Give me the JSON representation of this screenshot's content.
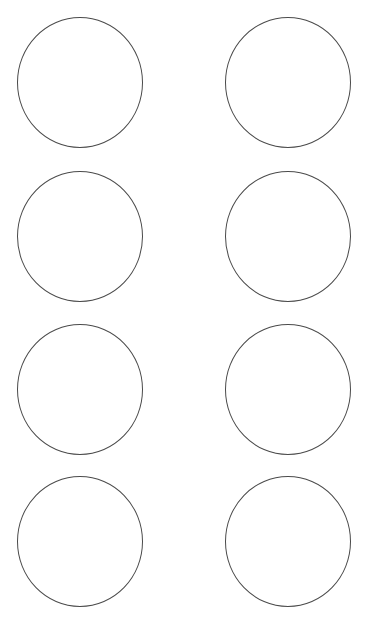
{
  "sheet": {
    "background": "#ffffff",
    "stroke_color": "#4a4a4a",
    "layout": {
      "columns": 2,
      "rows": 4
    },
    "circles": [
      {
        "row": 1,
        "col": 1,
        "cx": 80,
        "cy": 83,
        "r": 64
      },
      {
        "row": 1,
        "col": 2,
        "cx": 288,
        "cy": 83,
        "r": 64
      },
      {
        "row": 2,
        "col": 1,
        "cx": 80,
        "cy": 237,
        "r": 64
      },
      {
        "row": 2,
        "col": 2,
        "cx": 288,
        "cy": 237,
        "r": 64
      },
      {
        "row": 3,
        "col": 1,
        "cx": 80,
        "cy": 390,
        "r": 64
      },
      {
        "row": 3,
        "col": 2,
        "cx": 288,
        "cy": 390,
        "r": 64
      },
      {
        "row": 4,
        "col": 1,
        "cx": 80,
        "cy": 542,
        "r": 64
      },
      {
        "row": 4,
        "col": 2,
        "cx": 288,
        "cy": 542,
        "r": 64
      }
    ]
  }
}
